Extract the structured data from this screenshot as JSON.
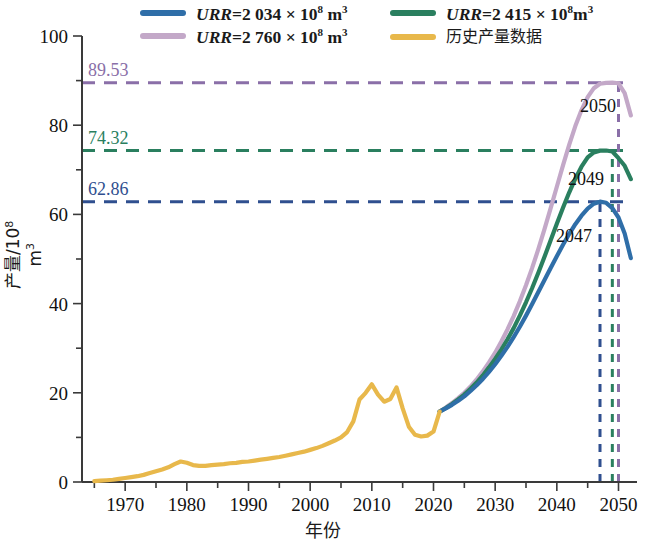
{
  "legend": {
    "items": [
      {
        "name": "urr-2034",
        "label_prefix": "URR",
        "label_eq": "=2 034 × 10",
        "label_exp": "8",
        "label_unit": " m",
        "label_unit_exp": "3",
        "color": "#2f6ea8",
        "style": "math"
      },
      {
        "name": "urr-2415",
        "label_prefix": "URR",
        "label_eq": "=2 415 × 10",
        "label_exp": "8",
        "label_unit": "m",
        "label_unit_exp": "3",
        "color": "#2a7f5f",
        "style": "math"
      },
      {
        "name": "urr-2760",
        "label_prefix": "URR",
        "label_eq": "=2 760 × 10",
        "label_exp": "8",
        "label_unit": " m",
        "label_unit_exp": "3",
        "color": "#c3a8c8",
        "style": "math"
      },
      {
        "name": "historical",
        "label_cjk": "历史产量数据",
        "color": "#e8b84b",
        "style": "cjk"
      }
    ]
  },
  "axes": {
    "x_label": "年份",
    "y_label_main": "产量/10",
    "y_label_exp": "8",
    "y_label_unit": " m",
    "y_label_unit_exp": "3",
    "x_ticks": [
      "1970",
      "1980",
      "1990",
      "2000",
      "2010",
      "2020",
      "2030",
      "2040",
      "2050"
    ],
    "y_ticks": [
      "0",
      "20",
      "40",
      "60",
      "80",
      "100"
    ]
  },
  "annotations": {
    "peaks": [
      {
        "name": "peak-value-8953",
        "value": "89.53",
        "color": "#8a6fa8",
        "y": 89.53,
        "year": 2050,
        "year_label": "2050"
      },
      {
        "name": "peak-value-7432",
        "value": "74.32",
        "color": "#2a7f5f",
        "y": 74.32,
        "year": 2049,
        "year_label": "2049"
      },
      {
        "name": "peak-value-6286",
        "value": "62.86",
        "color": "#2f4f8f",
        "y": 62.86,
        "year": 2047,
        "year_label": "2047"
      }
    ]
  },
  "chart_data": {
    "type": "line",
    "title": "",
    "xlabel": "年份",
    "ylabel": "产量/10^8 m^3",
    "xlim": [
      1963,
      2053
    ],
    "ylim": [
      0,
      100
    ],
    "grid": false,
    "legend_position": "top",
    "series": [
      {
        "name": "历史产量数据",
        "color": "#e8b84b",
        "x": [
          1965,
          1966,
          1967,
          1968,
          1969,
          1970,
          1971,
          1972,
          1973,
          1974,
          1975,
          1976,
          1977,
          1978,
          1979,
          1980,
          1981,
          1982,
          1983,
          1984,
          1985,
          1986,
          1987,
          1988,
          1989,
          1990,
          1991,
          1992,
          1993,
          1994,
          1995,
          1996,
          1997,
          1998,
          1999,
          2000,
          2001,
          2002,
          2003,
          2004,
          2005,
          2006,
          2007,
          2008,
          2009,
          2010,
          2011,
          2012,
          2013,
          2014,
          2015,
          2016,
          2017,
          2018,
          2019,
          2020,
          2021
        ],
        "values": [
          0.2,
          0.3,
          0.4,
          0.5,
          0.7,
          0.9,
          1.1,
          1.3,
          1.6,
          2.0,
          2.4,
          2.8,
          3.3,
          4.0,
          4.6,
          4.3,
          3.8,
          3.6,
          3.6,
          3.8,
          3.9,
          4.0,
          4.2,
          4.3,
          4.5,
          4.6,
          4.8,
          5.0,
          5.2,
          5.4,
          5.6,
          5.9,
          6.2,
          6.5,
          6.8,
          7.2,
          7.6,
          8.1,
          8.7,
          9.3,
          10.0,
          11.2,
          13.6,
          18.5,
          20.0,
          21.9,
          19.6,
          18.0,
          18.6,
          21.2,
          16.5,
          12.4,
          10.6,
          10.2,
          10.4,
          11.3,
          15.8
        ]
      },
      {
        "name": "URR=2 034 × 10^8 m^3",
        "color": "#2f6ea8",
        "peak_year": 2047,
        "peak_value": 62.86,
        "x": [
          2021,
          2022,
          2023,
          2024,
          2025,
          2026,
          2027,
          2028,
          2029,
          2030,
          2031,
          2032,
          2033,
          2034,
          2035,
          2036,
          2037,
          2038,
          2039,
          2040,
          2041,
          2042,
          2043,
          2044,
          2045,
          2046,
          2047,
          2048,
          2049,
          2050,
          2051,
          2052
        ],
        "values": [
          15.8,
          16.5,
          17.3,
          18.2,
          19.2,
          20.4,
          21.7,
          23.1,
          24.7,
          26.4,
          28.3,
          30.3,
          32.5,
          34.8,
          37.3,
          39.9,
          42.6,
          45.3,
          48.0,
          50.6,
          53.2,
          55.6,
          57.8,
          59.7,
          61.3,
          62.4,
          62.86,
          62.6,
          61.4,
          59.3,
          55.7,
          50.2
        ]
      },
      {
        "name": "URR=2 415 × 10^8 m^3",
        "color": "#2a7f5f",
        "peak_year": 2049,
        "peak_value": 74.32,
        "x": [
          2021,
          2022,
          2023,
          2024,
          2025,
          2026,
          2027,
          2028,
          2029,
          2030,
          2031,
          2032,
          2033,
          2034,
          2035,
          2036,
          2037,
          2038,
          2039,
          2040,
          2041,
          2042,
          2043,
          2044,
          2045,
          2046,
          2047,
          2048,
          2049,
          2050,
          2051,
          2052
        ],
        "values": [
          15.8,
          16.6,
          17.5,
          18.5,
          19.6,
          20.9,
          22.3,
          23.9,
          25.7,
          27.6,
          29.7,
          32.0,
          34.5,
          37.3,
          40.3,
          43.5,
          46.9,
          50.5,
          54.2,
          57.9,
          61.5,
          64.9,
          68.0,
          70.7,
          72.8,
          73.9,
          74.3,
          74.32,
          74.1,
          72.6,
          70.9,
          67.9
        ]
      },
      {
        "name": "URR=2 760 × 10^8 m^3",
        "color": "#c3a8c8",
        "peak_year": 2050,
        "peak_value": 89.53,
        "x": [
          2021,
          2022,
          2023,
          2024,
          2025,
          2026,
          2027,
          2028,
          2029,
          2030,
          2031,
          2032,
          2033,
          2034,
          2035,
          2036,
          2037,
          2038,
          2039,
          2040,
          2041,
          2042,
          2043,
          2044,
          2045,
          2046,
          2047,
          2048,
          2049,
          2050,
          2051,
          2052
        ],
        "values": [
          15.8,
          16.7,
          17.7,
          18.8,
          20.0,
          21.4,
          23.0,
          24.8,
          26.8,
          29.0,
          31.5,
          34.2,
          37.2,
          40.5,
          44.1,
          48.0,
          52.2,
          56.7,
          61.4,
          66.2,
          71.0,
          75.6,
          79.8,
          83.4,
          86.3,
          88.3,
          89.3,
          89.5,
          89.53,
          89.4,
          87.2,
          82.2
        ]
      }
    ],
    "reference_lines": [
      {
        "name": "hline-89.53",
        "value": 89.53,
        "color": "#8a6fa8",
        "style": "dashed",
        "orientation": "horizontal"
      },
      {
        "name": "hline-74.32",
        "value": 74.32,
        "color": "#2a7f5f",
        "style": "dashed",
        "orientation": "horizontal"
      },
      {
        "name": "hline-62.86",
        "value": 62.86,
        "color": "#2f4f8f",
        "style": "dashed",
        "orientation": "horizontal"
      },
      {
        "name": "vline-2050",
        "value": 2050,
        "color": "#8a6fa8",
        "style": "dashed",
        "orientation": "vertical"
      },
      {
        "name": "vline-2049",
        "value": 2049,
        "color": "#2a7f5f",
        "style": "dashed",
        "orientation": "vertical"
      },
      {
        "name": "vline-2047",
        "value": 2047,
        "color": "#2f4f8f",
        "style": "dashed",
        "orientation": "vertical"
      }
    ]
  }
}
